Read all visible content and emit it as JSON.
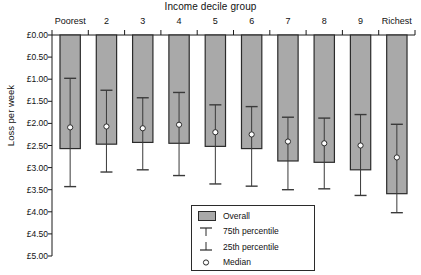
{
  "chart_data": {
    "type": "bar",
    "title": "Income decile group",
    "xlabel": "Income decile group",
    "ylabel": "Loss per week",
    "categories": [
      "Poorest",
      "2",
      "3",
      "4",
      "5",
      "6",
      "7",
      "8",
      "9",
      "Richest"
    ],
    "ytick_labels": [
      "£0.00",
      "£0.50",
      "£1.00",
      "£1.50",
      "£2.00",
      "£2.50",
      "£3.00",
      "£3.50",
      "£4.00",
      "£4.50",
      "£5.00"
    ],
    "ytick_values": [
      0,
      0.5,
      1.0,
      1.5,
      2.0,
      2.5,
      3.0,
      3.5,
      4.0,
      4.5,
      5.0
    ],
    "ylim": [
      0,
      5
    ],
    "y_inverted": true,
    "grid": false,
    "legend_position": "inside-bottom-center",
    "series": [
      {
        "name": "Overall",
        "values": [
          2.57,
          2.47,
          2.43,
          2.45,
          2.52,
          2.57,
          2.85,
          2.88,
          3.05,
          3.59
        ]
      },
      {
        "name": "75th percentile",
        "values": [
          0.98,
          1.25,
          1.42,
          1.3,
          1.58,
          1.62,
          1.86,
          1.88,
          1.8,
          2.02
        ]
      },
      {
        "name": "25th percentile",
        "values": [
          3.43,
          3.1,
          3.05,
          3.18,
          3.37,
          3.42,
          3.5,
          3.48,
          3.63,
          4.02
        ]
      },
      {
        "name": "Median",
        "values": [
          2.09,
          2.07,
          2.11,
          2.03,
          2.2,
          2.25,
          2.41,
          2.45,
          2.5,
          2.77
        ]
      }
    ],
    "colors": {
      "bar_fill": "#a9a9a9",
      "bar_stroke": "#2b2b2b",
      "whisker": "#3a3a3a",
      "median_marker": "#ffffff",
      "axis": "#1a1a1a"
    }
  },
  "legend": {
    "items": [
      {
        "label": "Overall",
        "key": "swatch-gray"
      },
      {
        "label": "75th percentile",
        "key": "tee-up-icon"
      },
      {
        "label": "25th percentile",
        "key": "tee-down-icon"
      },
      {
        "label": "Median",
        "key": "circle-marker-icon"
      }
    ]
  }
}
